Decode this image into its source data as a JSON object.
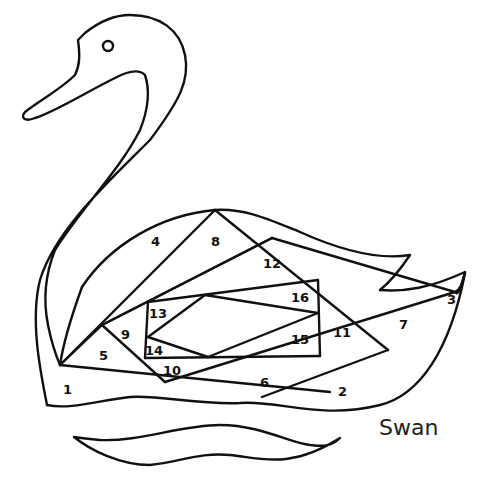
{
  "diagram": {
    "title": "Swan",
    "type": "iris-folding-pattern",
    "colors": {
      "line": "#111111",
      "background": "#ffffff"
    },
    "regions": [
      {
        "id": "1",
        "label": "1",
        "x": 68,
        "y": 389
      },
      {
        "id": "2",
        "label": "2",
        "x": 343,
        "y": 392
      },
      {
        "id": "3",
        "label": "3",
        "x": 451,
        "y": 302
      },
      {
        "id": "4",
        "label": "4",
        "x": 156,
        "y": 245
      },
      {
        "id": "5",
        "label": "5",
        "x": 104,
        "y": 357
      },
      {
        "id": "6",
        "label": "6",
        "x": 264,
        "y": 384
      },
      {
        "id": "7",
        "label": "7",
        "x": 404,
        "y": 327
      },
      {
        "id": "8",
        "label": "8",
        "x": 216,
        "y": 245
      },
      {
        "id": "9",
        "label": "9",
        "x": 126,
        "y": 337
      },
      {
        "id": "10",
        "label": "10",
        "x": 172,
        "y": 374
      },
      {
        "id": "11",
        "label": "11",
        "x": 342,
        "y": 336
      },
      {
        "id": "12",
        "label": "12",
        "x": 272,
        "y": 266
      },
      {
        "id": "13",
        "label": "13",
        "x": 158,
        "y": 317
      },
      {
        "id": "14",
        "label": "14",
        "x": 154,
        "y": 354
      },
      {
        "id": "15",
        "label": "15",
        "x": 300,
        "y": 343
      },
      {
        "id": "16",
        "label": "16",
        "x": 300,
        "y": 301
      }
    ]
  }
}
